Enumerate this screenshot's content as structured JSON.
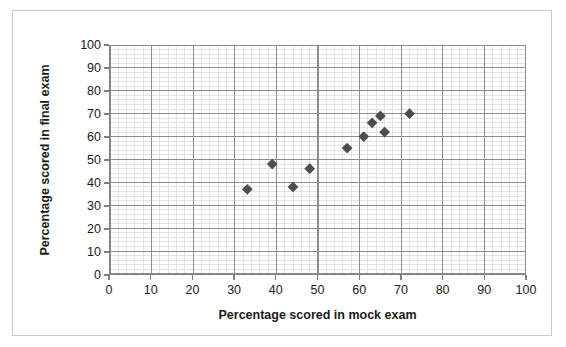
{
  "chart_data": {
    "type": "scatter",
    "title": "",
    "xlabel": "Percentage scored in mock exam",
    "ylabel": "Percentage scored in final exam",
    "xlim": [
      0,
      100
    ],
    "ylim": [
      0,
      100
    ],
    "xticks": [
      0,
      10,
      20,
      30,
      40,
      50,
      60,
      70,
      80,
      90,
      100
    ],
    "yticks": [
      0,
      10,
      20,
      30,
      40,
      50,
      60,
      70,
      80,
      90,
      100
    ],
    "xtick_labels": [
      "0",
      "10",
      "20",
      "30",
      "40",
      "50",
      "60",
      "70",
      "80",
      "90",
      "100"
    ],
    "ytick_labels": [
      "0",
      "10",
      "20",
      "30",
      "40",
      "50",
      "60",
      "70",
      "80",
      "90",
      "100"
    ],
    "grid": true,
    "grid_major_step": 10,
    "grid_minor_step": 2,
    "legend": false,
    "marker": "diamond",
    "marker_color": "#4d4d4d",
    "points": [
      {
        "x": 33,
        "y": 37
      },
      {
        "x": 39,
        "y": 48
      },
      {
        "x": 44,
        "y": 38
      },
      {
        "x": 48,
        "y": 46
      },
      {
        "x": 57,
        "y": 55
      },
      {
        "x": 61,
        "y": 60
      },
      {
        "x": 63,
        "y": 66
      },
      {
        "x": 65,
        "y": 69
      },
      {
        "x": 66,
        "y": 62
      },
      {
        "x": 72,
        "y": 70
      }
    ]
  },
  "style": {
    "axis_color": "#808080",
    "major_grid_color": "#8c8c8c",
    "minor_grid_color": "#d8d8d8",
    "frame_color": "#c9c9c9",
    "text_color": "#1a1a1a",
    "background": "#ffffff"
  }
}
